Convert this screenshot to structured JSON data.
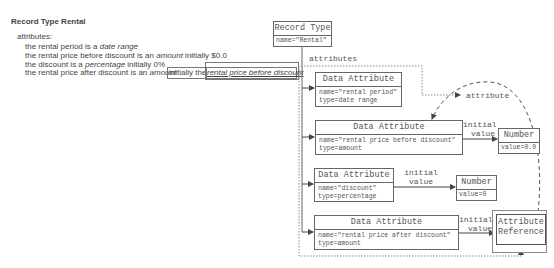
{
  "text_spec": {
    "title_prefix": "Record Type",
    "title_name": "Rental",
    "attributes_header": "attributes:",
    "lines": [
      {
        "pre": "the rental period is a ",
        "type": "date range",
        "post": ""
      },
      {
        "pre": "the rental price before discount is an ",
        "type": "amount",
        "post": " initially $0.0"
      },
      {
        "pre": "the discount is a ",
        "type": "percentage",
        "post": " initially 0%"
      },
      {
        "pre": "the rental price after discount is an ",
        "type": "amount",
        "post": ""
      }
    ],
    "highlight_initially": "initially the",
    "highlight_reference": "rental price before discount"
  },
  "diagram": {
    "record_type": {
      "header": "Record Type",
      "body": "name=\"Rental\""
    },
    "attributes_label": "attributes",
    "attribute_label": "attribute",
    "data_attributes": [
      {
        "header": "Data Attribute",
        "body": "name=\"rental period\"\ntype=date range"
      },
      {
        "header": "Data Attribute",
        "body": "name=\"rental price before discount\"\ntype=amount"
      },
      {
        "header": "Data Attribute",
        "body": "name=\"discount\"\ntype=percentage"
      },
      {
        "header": "Data Attribute",
        "body": "name=\"rental price after discount\"\ntype=amount"
      }
    ],
    "numbers": [
      {
        "header": "Number",
        "body": "value=0.0"
      },
      {
        "header": "Number",
        "body": "value=0"
      }
    ],
    "attribute_reference": {
      "header_line1": "Attribute",
      "header_line2": "Reference"
    },
    "initial_value_label_line1": "initial",
    "initial_value_label_line2": "value"
  }
}
